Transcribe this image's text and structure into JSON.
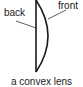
{
  "diagram": {
    "labels": {
      "back": "back",
      "front": "front"
    },
    "caption": "a convex lens",
    "colors": {
      "stroke": "#1a1a1a",
      "background": "#ffffff"
    }
  }
}
